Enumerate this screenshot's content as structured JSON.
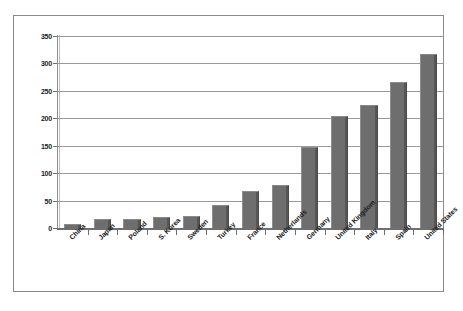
{
  "chart_data": {
    "type": "bar",
    "title": "",
    "subtitle": "",
    "xlabel": "",
    "ylabel": "",
    "ylim": [
      0,
      350
    ],
    "ytick_values": [
      0,
      50,
      100,
      150,
      200,
      250,
      300,
      350
    ],
    "ytick_labels": [
      "0",
      "50",
      "100",
      "150",
      "200",
      "250",
      "300",
      "350"
    ],
    "grid": true,
    "legend": false,
    "legend_position": "none",
    "categories": [
      "China",
      "Japan",
      "Poland",
      "S. Korea",
      "Sweden",
      "Turkey",
      "France",
      "Netherlands",
      "Germany",
      "United Kingdom",
      "Italy",
      "Spain",
      "United States"
    ],
    "values": [
      7,
      17,
      16,
      20,
      22,
      42,
      68,
      78,
      148,
      205,
      225,
      267,
      318
    ],
    "bar_color": "#6e6e6e",
    "gridline_color": "#9a9a9a",
    "axis_color": "#6f6f6f",
    "background_color": "#ffffff",
    "border_color": "#8a8a8a"
  }
}
